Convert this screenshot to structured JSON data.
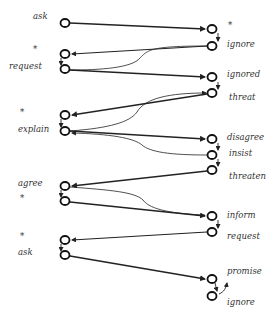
{
  "diagram": {
    "type": "dialogue-state-transition",
    "left_labels": [
      {
        "id": "L1",
        "text": "ask",
        "x": 33,
        "y": 11
      },
      {
        "id": "L2",
        "text": "*",
        "x": 33,
        "y": 45
      },
      {
        "id": "L3",
        "text": "request",
        "x": 9,
        "y": 61
      },
      {
        "id": "L4",
        "text": "*",
        "x": 20,
        "y": 108
      },
      {
        "id": "L5",
        "text": "explain",
        "x": 18,
        "y": 124
      },
      {
        "id": "L6",
        "text": "agree",
        "x": 18,
        "y": 178
      },
      {
        "id": "L7",
        "text": "*",
        "x": 20,
        "y": 193
      },
      {
        "id": "L8",
        "text": "*",
        "x": 20,
        "y": 232
      },
      {
        "id": "L9",
        "text": "ask",
        "x": 18,
        "y": 247
      }
    ],
    "right_labels": [
      {
        "id": "R1",
        "text": "*",
        "x": 227,
        "y": 21
      },
      {
        "id": "R2",
        "text": "ignore",
        "x": 227,
        "y": 39
      },
      {
        "id": "R3",
        "text": "ignored",
        "x": 227,
        "y": 69
      },
      {
        "id": "R4",
        "text": "threat",
        "x": 229,
        "y": 91
      },
      {
        "id": "R5",
        "text": "disagree",
        "x": 227,
        "y": 131
      },
      {
        "id": "R6",
        "text": "insist",
        "x": 229,
        "y": 148
      },
      {
        "id": "R7",
        "text": "threaten",
        "x": 229,
        "y": 171
      },
      {
        "id": "R8",
        "text": "inform",
        "x": 227,
        "y": 209
      },
      {
        "id": "R9",
        "text": "request",
        "x": 227,
        "y": 231
      },
      {
        "id": "R10",
        "text": "promise",
        "x": 227,
        "y": 266
      },
      {
        "id": "R11",
        "text": "ignore",
        "x": 227,
        "y": 297
      }
    ],
    "left_nodes": [
      {
        "id": "a1",
        "x": 65,
        "y": 23
      },
      {
        "id": "a2",
        "x": 65,
        "y": 54
      },
      {
        "id": "a3",
        "x": 65,
        "y": 69
      },
      {
        "id": "a4",
        "x": 65,
        "y": 115
      },
      {
        "id": "a5",
        "x": 65,
        "y": 131
      },
      {
        "id": "a6",
        "x": 65,
        "y": 186
      },
      {
        "id": "a7",
        "x": 65,
        "y": 201
      },
      {
        "id": "a8",
        "x": 65,
        "y": 240
      },
      {
        "id": "a9",
        "x": 65,
        "y": 255
      }
    ],
    "right_nodes": [
      {
        "id": "b1",
        "x": 212,
        "y": 29
      },
      {
        "id": "b2",
        "x": 212,
        "y": 46
      },
      {
        "id": "b3",
        "x": 212,
        "y": 77
      },
      {
        "id": "b4",
        "x": 212,
        "y": 93
      },
      {
        "id": "b5",
        "x": 212,
        "y": 139
      },
      {
        "id": "b6",
        "x": 212,
        "y": 155
      },
      {
        "id": "b7",
        "x": 212,
        "y": 170
      },
      {
        "id": "b8",
        "x": 212,
        "y": 216
      },
      {
        "id": "b9",
        "x": 212,
        "y": 232
      },
      {
        "id": "b10",
        "x": 212,
        "y": 279
      },
      {
        "id": "b11",
        "x": 212,
        "y": 296
      }
    ],
    "edges": [
      {
        "from": "ask",
        "to": "*",
        "style": "bold"
      },
      {
        "from": "ignore",
        "to": "*",
        "style": "bold"
      },
      {
        "from": "ignore",
        "to": "request",
        "style": "thin-curve"
      },
      {
        "from": "request",
        "to": "ignored",
        "style": "bold"
      },
      {
        "from": "threat",
        "to": "*",
        "style": "bold"
      },
      {
        "from": "explain",
        "to": "threat",
        "style": "thin-curve"
      },
      {
        "from": "explain",
        "to": "disagree",
        "style": "bold"
      },
      {
        "from": "insist",
        "to": "explain",
        "style": "thin-curve"
      },
      {
        "from": "threaten",
        "to": "agree",
        "style": "bold"
      },
      {
        "from": "agree",
        "to": "inform",
        "style": "thin-curve"
      },
      {
        "from": "*",
        "to": "inform",
        "style": "bold"
      },
      {
        "from": "request",
        "to": "*",
        "style": "bold"
      },
      {
        "from": "ask",
        "to": "promise",
        "style": "bold"
      }
    ]
  }
}
